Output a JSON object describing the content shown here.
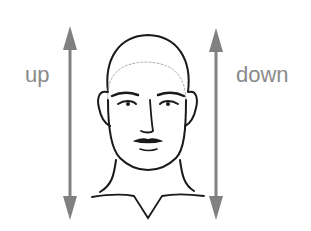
{
  "diagram": {
    "labels": {
      "left": "up",
      "right": "down"
    },
    "colors": {
      "arrow": "#808080",
      "label": "#8a8a8a",
      "line": "#1a1a1a",
      "hairline": "#aaaaaa"
    },
    "elements": [
      "up-arrow (double-headed, left)",
      "down-arrow (double-headed, right)",
      "face line drawing with dotted hairline"
    ]
  }
}
